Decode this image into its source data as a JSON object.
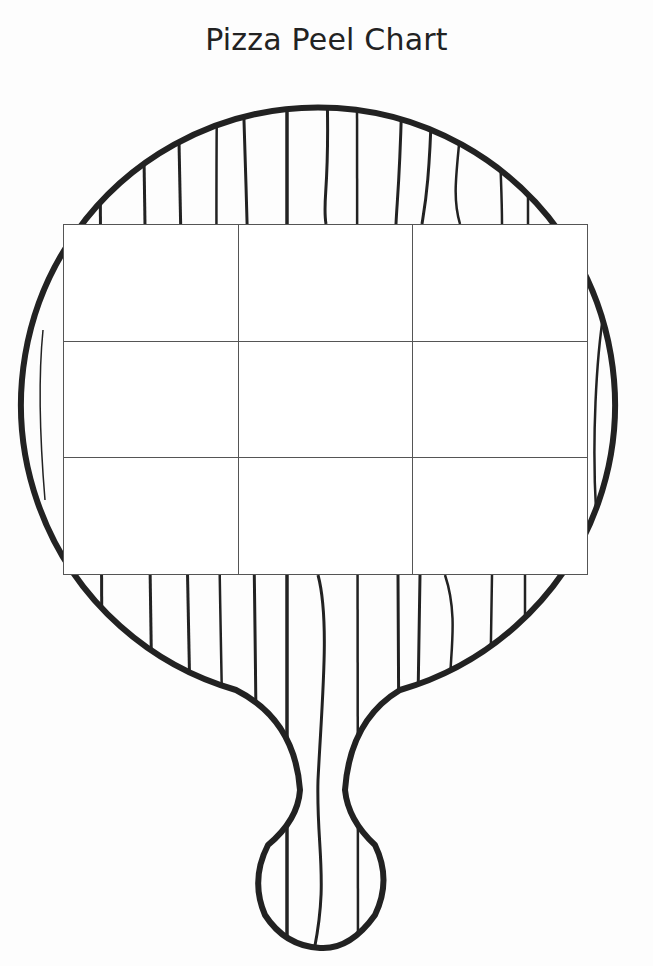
{
  "title": "Pizza Peel Chart",
  "chart": {
    "rows": 3,
    "columns": 3,
    "cells": [
      [
        "",
        "",
        ""
      ],
      [
        "",
        "",
        ""
      ],
      [
        "",
        "",
        ""
      ]
    ]
  },
  "colors": {
    "outline": "#222222",
    "grid_line": "#555555",
    "background": "#fdfdfd"
  },
  "illustration": "wooden-pizza-peel"
}
